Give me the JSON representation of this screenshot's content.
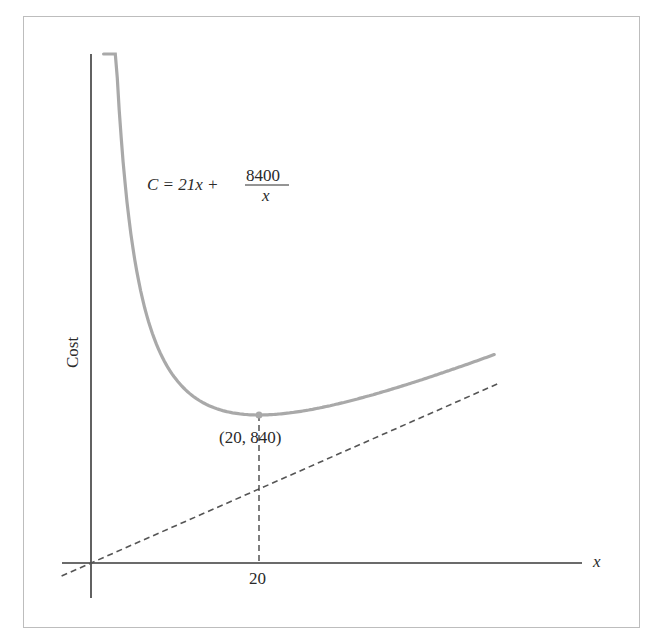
{
  "chart_data": {
    "type": "line",
    "title": "",
    "xlabel": "x",
    "ylabel": "Cost",
    "equation": {
      "lhs": "C = 21x +",
      "numerator": "8400",
      "denominator": "x"
    },
    "series": [
      {
        "name": "C = 21x + 8400/x",
        "style": "solid",
        "color": "#a9a9a9",
        "x": [
          1.5,
          2,
          3,
          4,
          5,
          6,
          8,
          10,
          12,
          15,
          20,
          25,
          30,
          35,
          40,
          45,
          48
        ],
        "values": [
          5631.5,
          4242,
          2863,
          2184,
          1785,
          1526,
          1218,
          1050,
          952,
          875,
          840,
          861,
          910,
          975,
          1050,
          1132,
          1183
        ]
      },
      {
        "name": "C = 21x (asymptote)",
        "style": "dashed",
        "color": "#555555",
        "x": [
          -3.5,
          48.5
        ],
        "values": [
          -73.5,
          1018.5
        ]
      }
    ],
    "annotations": [
      {
        "label": "(20, 840)",
        "x": 20,
        "y": 840,
        "marker": "point",
        "dropline": true
      }
    ],
    "xticks": [
      {
        "value": 20,
        "label": "20"
      }
    ],
    "yticks": [],
    "grid": false,
    "legend": "none"
  },
  "labels": {
    "x_axis": "x",
    "y_axis": "Cost",
    "eq_lhs": "C = 21x +",
    "eq_num": "8400",
    "eq_den": "x",
    "min_point": "(20, 840)",
    "x_tick": "20"
  },
  "colors": {
    "curve": "#a9a9a9",
    "axes": "#3a3a3a",
    "dashed": "#555555",
    "frame": "#bdbdbd"
  }
}
